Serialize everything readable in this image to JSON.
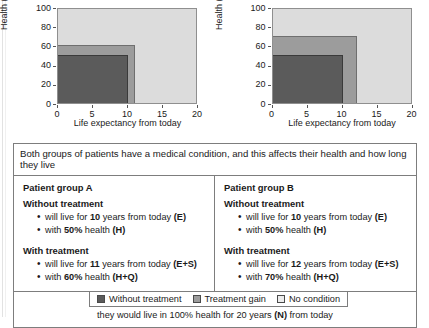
{
  "chart_data": [
    {
      "type": "area",
      "title": "",
      "xlabel": "Life expectancy from today",
      "ylabel": "Health (%)",
      "xlim": [
        0,
        20
      ],
      "ylim": [
        0,
        100
      ],
      "xticks": [
        0,
        5,
        10,
        15,
        20
      ],
      "yticks": [
        0,
        20,
        40,
        60,
        80,
        100
      ],
      "grid": false,
      "group": "A",
      "regions": [
        {
          "name": "Without treatment",
          "x_end": 10,
          "y_end": 50,
          "color": "#5b5b5b"
        },
        {
          "name": "Treatment gain",
          "x_end": 11,
          "y_end": 60,
          "color": "#9c9c9c"
        },
        {
          "name": "No condition",
          "x_end": 20,
          "y_end": 100,
          "color": "#dcdcdc"
        }
      ]
    },
    {
      "type": "area",
      "title": "",
      "xlabel": "Life expectancy from today",
      "ylabel": "Health (%)",
      "xlim": [
        0,
        20
      ],
      "ylim": [
        0,
        100
      ],
      "xticks": [
        0,
        5,
        10,
        15,
        20
      ],
      "yticks": [
        0,
        20,
        40,
        60,
        80,
        100
      ],
      "grid": false,
      "group": "B",
      "regions": [
        {
          "name": "Without treatment",
          "x_end": 10,
          "y_end": 50,
          "color": "#5b5b5b"
        },
        {
          "name": "Treatment gain",
          "x_end": 12,
          "y_end": 70,
          "color": "#9c9c9c"
        },
        {
          "name": "No condition",
          "x_end": 20,
          "y_end": 100,
          "color": "#dcdcdc"
        }
      ]
    }
  ],
  "charts": {
    "left": {
      "ylabel": "Health (%)",
      "xlabel": "Life expectancy from today",
      "yticks": [
        "0",
        "20",
        "40",
        "60",
        "80",
        "100"
      ],
      "xticks": [
        "0",
        "5",
        "10",
        "15",
        "20"
      ]
    },
    "right": {
      "ylabel": "Health (%)",
      "xlabel": "Life expectancy from today",
      "yticks": [
        "0",
        "20",
        "40",
        "60",
        "80",
        "100"
      ],
      "xticks": [
        "0",
        "5",
        "10",
        "15",
        "20"
      ]
    }
  },
  "panel": {
    "banner": "Both groups of patients have a medical condition, and this affects their health and how long they live",
    "group_a": {
      "title": "Patient group A",
      "without_heading": "Without treatment",
      "without_items": [
        {
          "pre": "will live for ",
          "bold1": "10",
          "mid": " years from today ",
          "bold2": "(E)",
          "post": ""
        },
        {
          "pre": "with ",
          "bold1": "50%",
          "mid": " health ",
          "bold2": "(H)",
          "post": ""
        }
      ],
      "with_heading": "With treatment",
      "with_items": [
        {
          "pre": "will live for ",
          "bold1": "11",
          "mid": " years from today ",
          "bold2": "(E+S)",
          "post": ""
        },
        {
          "pre": "with ",
          "bold1": "60%",
          "mid": " health ",
          "bold2": "(H+Q)",
          "post": ""
        }
      ]
    },
    "group_b": {
      "title": "Patient group B",
      "without_heading": "Without treatment",
      "without_items": [
        {
          "pre": "will live for ",
          "bold1": "10",
          "mid": " years from today ",
          "bold2": "(E)",
          "post": ""
        },
        {
          "pre": "with ",
          "bold1": "50%",
          "mid": " health ",
          "bold2": "(H)",
          "post": ""
        }
      ],
      "with_heading": "With treatment",
      "with_items": [
        {
          "pre": "will live for ",
          "bold1": "12",
          "mid": " years from today ",
          "bold2": "(E+S)",
          "post": ""
        },
        {
          "pre": "with ",
          "bold1": "70%",
          "mid": " health ",
          "bold2": "(H+Q)",
          "post": ""
        }
      ]
    },
    "footer": {
      "line1": "If these patient did not have a medical condition",
      "line2_pre": "they would live in 100% health for 20 years ",
      "line2_bold": "(N)",
      "line2_post": " from today"
    }
  },
  "legend": {
    "items": [
      {
        "label": "Without treatment",
        "color": "#5b5b5b",
        "swatch": "dark"
      },
      {
        "label": "Treatment gain",
        "color": "#9c9c9c",
        "swatch": "mid"
      },
      {
        "label": "No condition",
        "color": "#ececec",
        "swatch": "light"
      }
    ]
  }
}
